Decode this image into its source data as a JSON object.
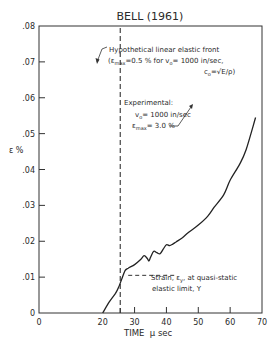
{
  "chart_data": {
    "type": "line",
    "title": "BELL (1961)",
    "xlabel": "TIME  μ sec",
    "ylabel": "ε %",
    "xlim": [
      0,
      70
    ],
    "ylim": [
      0,
      0.08
    ],
    "x_ticks": [
      "0",
      "20",
      "30",
      "40",
      "50",
      "60",
      "70"
    ],
    "y_ticks": [
      "0",
      ".01",
      ".02",
      ".03",
      ".04",
      ".05",
      ".06",
      ".07",
      ".08"
    ],
    "grid": false,
    "series": [
      {
        "name": "Experimental",
        "x": [
          20,
          22,
          24,
          25,
          26,
          27,
          28,
          30,
          32,
          33,
          34,
          34.5,
          35,
          36,
          37,
          38,
          39,
          40,
          41,
          42,
          43,
          45,
          47,
          50,
          53,
          55,
          58,
          60,
          63,
          65,
          68
        ],
        "y": [
          0,
          0.003,
          0.0055,
          0.0072,
          0.0095,
          0.0118,
          0.0125,
          0.0135,
          0.015,
          0.016,
          0.0152,
          0.0145,
          0.0155,
          0.0172,
          0.0168,
          0.0165,
          0.0178,
          0.019,
          0.0188,
          0.0192,
          0.0198,
          0.021,
          0.0225,
          0.0245,
          0.027,
          0.0295,
          0.033,
          0.037,
          0.0415,
          0.0455,
          0.0545
        ]
      }
    ],
    "reference_lines": [
      {
        "name": "Hypothetical linear elastic front",
        "orientation": "vertical",
        "x": 25.5,
        "style": "dashed"
      },
      {
        "name": "Strain at quasi-static elastic limit",
        "orientation": "horizontal",
        "y": 0.0105,
        "x_range": [
          28,
          38
        ],
        "style": "dashed"
      }
    ],
    "annotations": [
      {
        "text": "Hypothetical linear elastic front",
        "line2": "(εmax=0.5 % for v₀= 1000 in/sec,",
        "line3": "c₀=√(E/ρ))"
      },
      {
        "text": "Experimental:",
        "line2": "v₀= 1000 in/sec",
        "line3": "εmax= 3.0 %"
      },
      {
        "text": "Strain, εy, at quasi-static",
        "line2": "elastic limit, Y"
      }
    ]
  },
  "labels": {
    "title": "BELL (1961)",
    "ylabel": "ε %",
    "xlabel": "TIME  μ sec",
    "front_l1": "Hypothetical linear elastic front",
    "front_l2a": "(ε",
    "front_l2sub": "max",
    "front_l2b": "=0.5 % for v",
    "front_l2sub2": "o",
    "front_l2c": "= 1000 in/sec,",
    "front_l3a": "c",
    "front_l3sub": "o",
    "front_l3b": "=√E/ρ)",
    "exp_l1": "Experimental:",
    "exp_l2a": "v",
    "exp_l2sub": "o",
    "exp_l2b": "= 1000 in/sec",
    "exp_l3a": "ε",
    "exp_l3sub": "max",
    "exp_l3b": "= 3.0 %",
    "yield_l1": "Strain, ε",
    "yield_l1sub": "y",
    "yield_l1b": ", at quasi-static",
    "yield_l2": "elastic limit, Y"
  }
}
